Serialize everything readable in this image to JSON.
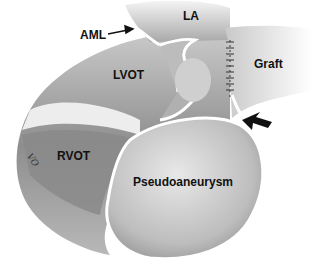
{
  "figure": {
    "type": "anatomical-illustration",
    "labels": {
      "aml": "AML",
      "la": "LA",
      "lvot": "LVOT",
      "graft": "Graft",
      "rvot": "RVOT",
      "pseudoaneurysm": "Pseudoaneurysm"
    },
    "signature": "VO",
    "colors": {
      "background": "#ffffff",
      "tissue_dark": "#7a7a7a",
      "tissue_mid": "#a8a8a8",
      "tissue_light": "#d6d6d6",
      "highlight": "#f2f2f2",
      "text": "#111111"
    }
  }
}
